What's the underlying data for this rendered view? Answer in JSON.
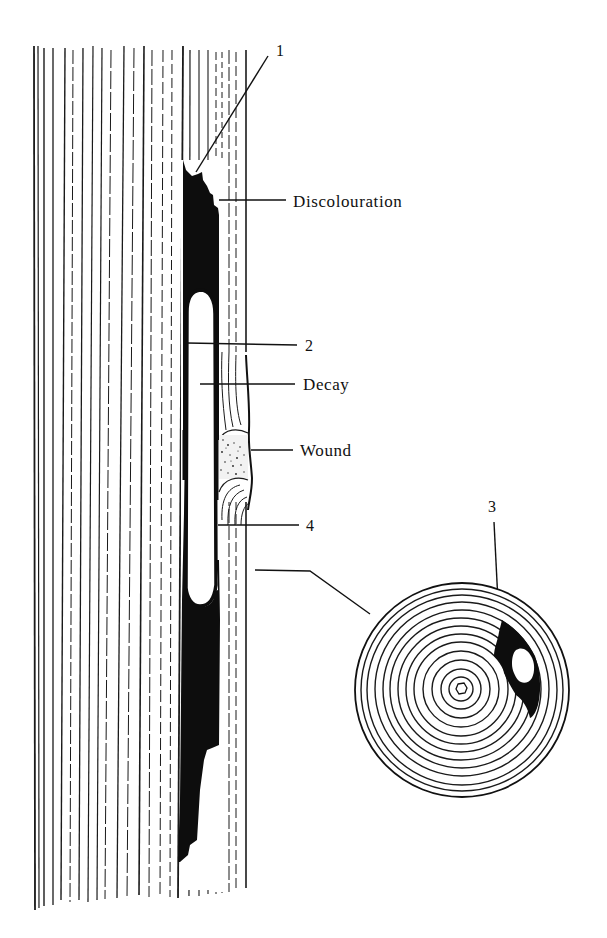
{
  "figure": {
    "colors": {
      "ink": "#111111",
      "background": "#ffffff"
    }
  },
  "labels": {
    "label_1": "1",
    "discolouration": "Discolouration",
    "label_2": "2",
    "decay": "Decay",
    "wound": "Wound",
    "label_4": "4",
    "label_3": "3"
  },
  "parts": {
    "trunk_section": "longitudinal-trunk-section",
    "cross_section": "cross-section-disc",
    "ring_count": 13
  }
}
